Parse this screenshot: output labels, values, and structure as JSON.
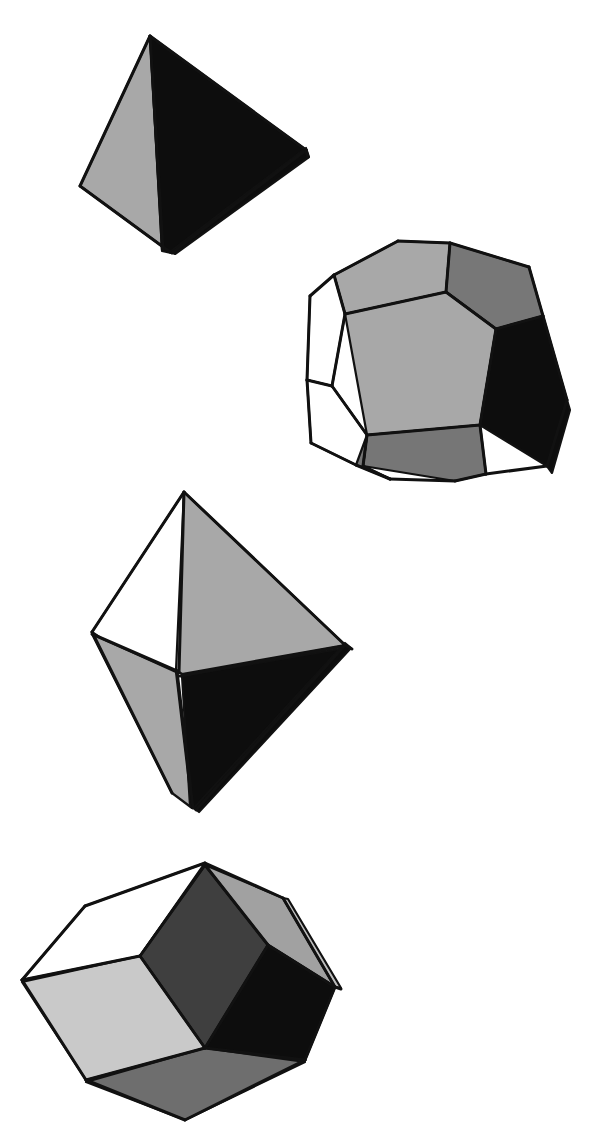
{
  "plate": {
    "title": "Polyhedra figure plate",
    "background_color": "#ffffff",
    "width": 613,
    "height": 1124,
    "caption": "",
    "figure_count": 4
  },
  "palette": {
    "black": "#0d0d0d",
    "outline": "#111111",
    "dark_gray": "#3a3a3a",
    "mid_gray": "#6e6e6e",
    "gray": "#9c9c9c",
    "light_gray": "#c6c6c6",
    "white": "#ffffff"
  },
  "figures": [
    {
      "id": "tetrahedron",
      "name": "Tetrahedron",
      "position_label": "top-left",
      "face_count_visible": 3,
      "faces": [
        {
          "name": "left-face",
          "shade": "gray",
          "fill": "#a8a8a8",
          "points": "150,36 80,186 170,252 162,250"
        },
        {
          "name": "front-face",
          "shade": "black",
          "fill": "#0d0d0d",
          "points": "150,36 306,150 171,253 162,251"
        },
        {
          "name": "right-sliver",
          "shade": "black",
          "fill": "#0d0d0d",
          "points": "306,148 309,157 175,254 170,252"
        }
      ],
      "edges": [
        "150,36 80,186",
        "80,186 170,252",
        "150,36 306,150",
        "306,150 172,253",
        "150,36 163,250",
        "306,150 308,157"
      ]
    },
    {
      "id": "dodecahedron",
      "name": "Regular dodecahedron",
      "position_label": "upper-right",
      "face_count_visible": 8,
      "faces": [
        {
          "name": "top-left-pentagon",
          "shade": "gray",
          "fill": "#a8a8a8",
          "points": "334,275 398,241 450,243 446,292 345,314"
        },
        {
          "name": "top-right-pentagon",
          "shade": "mid-gray",
          "fill": "#777777",
          "points": "450,243 529,267 543,316 496,329 446,292"
        },
        {
          "name": "center-pentagon",
          "shade": "gray",
          "fill": "#a8a8a8",
          "points": "345,314 446,292 496,329 480,425 367,435"
        },
        {
          "name": "right-black-pentagon",
          "shade": "black",
          "fill": "#0d0d0d",
          "points": "496,329 543,316 567,400 547,466 480,425"
        },
        {
          "name": "bottom-mid-pentagon",
          "shade": "mid-gray",
          "fill": "#767676",
          "points": "367,435 480,425 486,474 455,481 363,466"
        },
        {
          "name": "bottom-left-pentagon",
          "shade": "mid-gray",
          "fill": "#767676",
          "points": "355,437 367,435 363,466 390,479 356,465"
        },
        {
          "name": "left-upper-white-pentagon",
          "shade": "white",
          "fill": "#ffffff",
          "points": "310,296 334,275 345,314 332,386 307,380"
        },
        {
          "name": "left-lower-white-pentagon",
          "shade": "white",
          "fill": "#ffffff",
          "points": "307,380 332,386 367,435 356,465 311,443"
        },
        {
          "name": "right-lower-sliver",
          "shade": "black",
          "fill": "#0d0d0d",
          "points": "547,466 567,400 570,410 552,473"
        }
      ],
      "edges": [
        "334,275 398,241",
        "398,241 450,243",
        "450,243 529,267",
        "529,267 543,316",
        "543,316 567,400",
        "567,400 547,466",
        "547,466 486,474",
        "486,474 455,481",
        "455,481 390,479",
        "390,479 356,465",
        "356,465 311,443",
        "311,443 307,380",
        "307,380 310,296",
        "310,296 334,275",
        "334,275 345,314",
        "345,314 446,292",
        "446,292 450,243",
        "446,292 496,329",
        "496,329 543,316",
        "345,314 332,386",
        "332,386 367,435",
        "367,435 480,425",
        "480,425 496,329",
        "480,425 486,474",
        "367,435 363,466",
        "363,466 390,479",
        "332,386 307,380"
      ]
    },
    {
      "id": "octahedron",
      "name": "Octahedron",
      "position_label": "center-left",
      "face_count_visible": 4,
      "faces": [
        {
          "name": "upper-left-face",
          "shade": "white",
          "fill": "#ffffff",
          "points": "184,492 92,632 164,681 181,672"
        },
        {
          "name": "upper-right-face",
          "shade": "gray",
          "fill": "#a8a8a8",
          "points": "184,492 345,645 182,674 176,670"
        },
        {
          "name": "lower-left-face",
          "shade": "gray",
          "fill": "#a8a8a8",
          "points": "92,634 176,672 192,808 172,793"
        },
        {
          "name": "lower-right-face",
          "shade": "black",
          "fill": "#0d0d0d",
          "points": "182,676 345,648 197,810 190,806"
        },
        {
          "name": "right-tip-sliver",
          "shade": "black",
          "fill": "#0d0d0d",
          "points": "345,643 351,648 199,812 194,808"
        }
      ],
      "edges": [
        "184,492 92,632",
        "92,632 172,793",
        "184,492 345,645",
        "345,645 196,810",
        "184,492 179,672",
        "92,634 177,671",
        "345,646 180,676",
        "177,671 193,808",
        "345,645 352,649"
      ]
    },
    {
      "id": "rhombic-dodecahedron",
      "name": "Rhombic dodecahedron",
      "position_label": "bottom-left",
      "face_count_visible": 7,
      "faces": [
        {
          "name": "top-white-rhombus",
          "shade": "white",
          "fill": "#ffffff",
          "points": "205,863 85,906 22,980 140,956"
        },
        {
          "name": "top-dark-rhombus",
          "shade": "dark-gray",
          "fill": "#3f3f3f",
          "points": "205,865 140,956 205,1048 268,945"
        },
        {
          "name": "top-right-gray-rhombus",
          "shade": "gray",
          "fill": "#a1a1a1",
          "points": "205,865 268,945 335,987 283,898"
        },
        {
          "name": "right-black-rhombus",
          "shade": "black",
          "fill": "#0d0d0d",
          "points": "268,945 335,987 305,1060 205,1048"
        },
        {
          "name": "left-light-rhombus",
          "shade": "light-gray",
          "fill": "#c9c9c9",
          "points": "22,982 140,956 205,1048 86,1080"
        },
        {
          "name": "bottom-mid-rhombus",
          "shade": "mid-gray",
          "fill": "#6e6e6e",
          "points": "86,1082 205,1048 305,1062 185,1120"
        },
        {
          "name": "right-edge-sliver",
          "shade": "light-gray",
          "fill": "#bdbdbd",
          "points": "283,898 335,987 341,988 288,899"
        }
      ],
      "edges": [
        "205,863 85,906",
        "85,906 22,980",
        "22,980 86,1080",
        "86,1080 185,1120",
        "205,863 283,898",
        "283,898 335,987",
        "335,987 305,1060",
        "305,1060 185,1120",
        "205,865 140,956",
        "140,956 205,1048",
        "205,1048 268,945",
        "268,945 205,865",
        "140,956 22,980",
        "268,945 335,987",
        "205,1048 86,1080",
        "205,1048 305,1060",
        "335,987 341,989"
      ]
    }
  ]
}
